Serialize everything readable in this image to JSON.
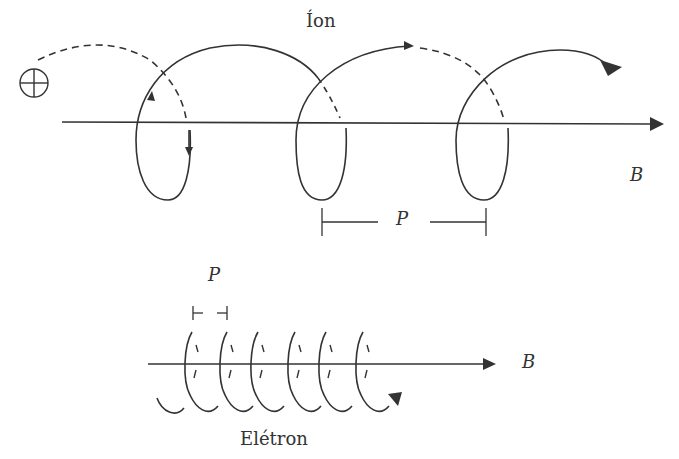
{
  "diagram": {
    "ion": {
      "label": "Íon",
      "charge_symbol": "⊕",
      "field_label": "B",
      "pitch_label": "P"
    },
    "electron": {
      "label": "Elétron",
      "field_label": "B",
      "pitch_label": "P"
    },
    "colors": {
      "stroke": "#333333",
      "background": "#ffffff"
    }
  }
}
